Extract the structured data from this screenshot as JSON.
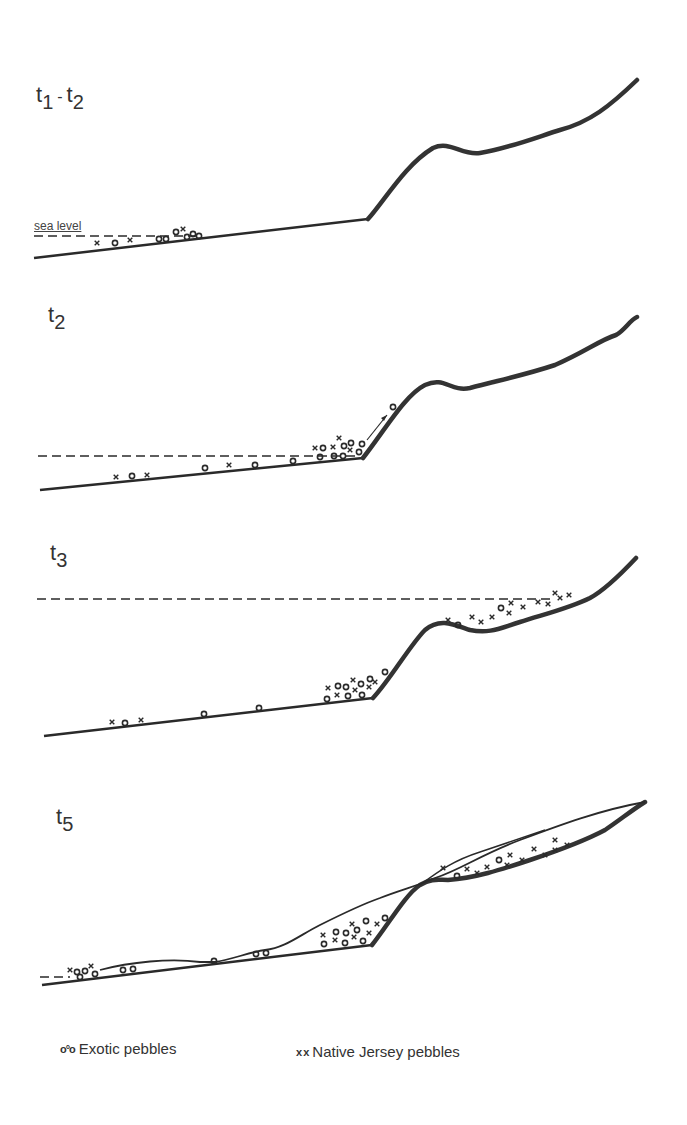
{
  "panels": [
    {
      "id": "t1-t2",
      "label_main": "t",
      "label_sub1": "1",
      "label_sep": "-",
      "label_t2": "t",
      "label_sub2": "2",
      "sea_level_label": "sea level"
    },
    {
      "id": "t2",
      "label_main": "t",
      "label_sub": "2"
    },
    {
      "id": "t3",
      "label_main": "t",
      "label_sub": "3"
    },
    {
      "id": "t5",
      "label_main": "t",
      "label_sub": "5"
    }
  ],
  "legend": {
    "exotic": {
      "glyph": "o°o",
      "label": "Exotic pebbles"
    },
    "native": {
      "glyph": "x x",
      "label": "Native Jersey pebbles"
    }
  },
  "colors": {
    "line": "#2a2a2a",
    "background": "#ffffff"
  }
}
